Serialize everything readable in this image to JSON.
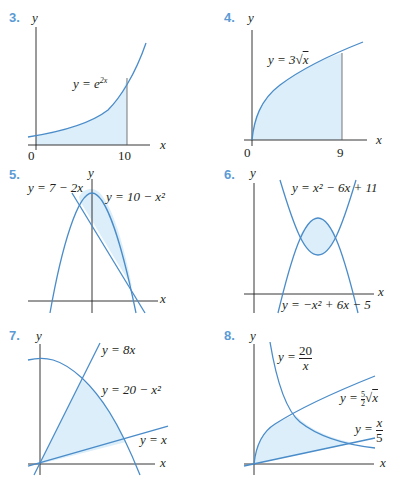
{
  "panels": [
    {
      "number": "3.",
      "y_axis": "y",
      "x_axis": "x",
      "equation": "y = e^{2x}",
      "eq_text": "y = e",
      "eq_sup": "2x",
      "ticks": [
        "0",
        "10"
      ]
    },
    {
      "number": "4.",
      "y_axis": "y",
      "x_axis": "x",
      "equation": "y = 3√x",
      "eq_text": "y = 3",
      "eq_rad": "x",
      "ticks": [
        "0",
        "9"
      ]
    },
    {
      "number": "5.",
      "y_axis": "y",
      "x_axis": "x",
      "equations": [
        "y = 7 − 2x",
        "y = 10 − x²"
      ]
    },
    {
      "number": "6.",
      "y_axis": "y",
      "x_axis": "x",
      "equations": [
        "y = x² − 6x + 11",
        "y = −x² + 6x − 5"
      ]
    },
    {
      "number": "7.",
      "y_axis": "y",
      "x_axis": "x",
      "equations": [
        "y = 8x",
        "y = 20 − x²",
        "y = x"
      ]
    },
    {
      "number": "8.",
      "y_axis": "y",
      "x_axis": "x",
      "equations": [
        "y = 20/x",
        "y = (5/2)√x",
        "y = x/5"
      ],
      "eq1_num": "20",
      "eq1_den": "x",
      "eq2_pre": "y = ",
      "eq2_num": "5",
      "eq2_den": "2",
      "eq2_rad": "x",
      "eq3_num": "x",
      "eq3_den": "5"
    }
  ],
  "colors": {
    "label": "#5b9bd5",
    "curve": "#4a8cc9",
    "shade": "#dbeef9",
    "axis": "#231f20"
  }
}
